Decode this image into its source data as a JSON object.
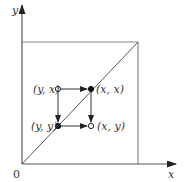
{
  "diagram": {
    "axes": {
      "x_label": "x",
      "y_label": "y",
      "origin_label": "0"
    },
    "points": [
      {
        "id": "yx",
        "label": "(y, x)",
        "fill": "open"
      },
      {
        "id": "xx",
        "label": "(x, x)",
        "fill": "filled"
      },
      {
        "id": "yy",
        "label": "(y, y)",
        "fill": "filled"
      },
      {
        "id": "xy",
        "label": "(x, y)",
        "fill": "open"
      }
    ],
    "arrows": [
      {
        "from": "yx",
        "to": "xx"
      },
      {
        "from": "yx",
        "to": "yy"
      },
      {
        "from": "xx",
        "to": "xy"
      },
      {
        "from": "yy",
        "to": "xy"
      }
    ],
    "colors": {
      "line": "#555555",
      "box": "#888888",
      "text": "#333333"
    }
  }
}
